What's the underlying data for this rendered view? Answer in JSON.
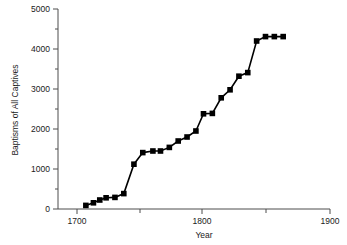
{
  "chart_data": {
    "type": "line",
    "title": "",
    "xlabel": "Year",
    "ylabel": "Baptisms of All Captives",
    "xlim": [
      1670,
      1900
    ],
    "ylim": [
      0,
      5000
    ],
    "grid": false,
    "legend": null,
    "x_ticks_major": [
      1700,
      1800,
      1900
    ],
    "x_ticks_major_labels": [
      "1700",
      "1800",
      "1900"
    ],
    "x_ticks_minor": [
      1750,
      1850
    ],
    "y_ticks_major": [
      0,
      1000,
      2000,
      3000,
      4000,
      5000
    ],
    "y_ticks_major_labels": [
      "0",
      "1000",
      "2000",
      "3000",
      "4000",
      "5000"
    ],
    "y_ticks_minor": [
      500,
      1500,
      2500,
      3500,
      4500
    ],
    "marker": "square",
    "series": [
      {
        "name": "Baptisms of All Captives",
        "color": "#000000",
        "x": [
          1707,
          1713,
          1718,
          1723,
          1730,
          1737,
          1745,
          1752,
          1760,
          1766,
          1773,
          1780,
          1787,
          1794,
          1800,
          1807,
          1814,
          1821,
          1828,
          1835,
          1842,
          1849,
          1856,
          1863
        ],
        "y": [
          90,
          155,
          225,
          280,
          290,
          385,
          1120,
          1410,
          1450,
          1450,
          1540,
          1700,
          1800,
          1950,
          2380,
          2390,
          2780,
          2980,
          3320,
          3410,
          4200,
          4310,
          4310,
          4310
        ]
      }
    ]
  },
  "axis_labels": {
    "x_title": "Year",
    "y_title": "Baptisms of All Captives",
    "x_tick_1": "1700",
    "x_tick_2": "1800",
    "x_tick_3": "1900",
    "y_tick_0": "0",
    "y_tick_1000": "1000",
    "y_tick_2000": "2000",
    "y_tick_3000": "3000",
    "y_tick_4000": "4000",
    "y_tick_5000": "5000"
  },
  "colors": {
    "series": "#000000",
    "axis": "#4d4d4d",
    "text": "#1a1a1a",
    "background": "#ffffff"
  }
}
